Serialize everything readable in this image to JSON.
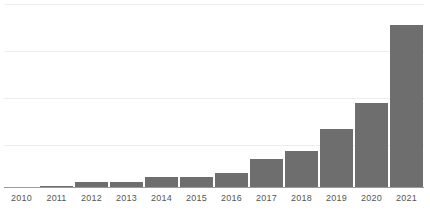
{
  "chart_data": {
    "type": "bar",
    "title": "",
    "subtitle": "",
    "xlabel": "",
    "ylabel": "",
    "categories": [
      "2010",
      "2011",
      "2012",
      "2013",
      "2014",
      "2015",
      "2016",
      "2017",
      "2018",
      "2019",
      "2020",
      "2021"
    ],
    "values": [
      0.0,
      1.2,
      3.4,
      4.0,
      6.5,
      7.0,
      9.5,
      18.0,
      23.0,
      36.0,
      52.0,
      100.0
    ],
    "series": [
      {
        "name": "Value",
        "values": [
          0.0,
          1.2,
          3.4,
          4.0,
          6.5,
          7.0,
          9.5,
          18.0,
          23.0,
          36.0,
          52.0,
          100.0
        ]
      }
    ],
    "ylim": [
      0,
      107
    ],
    "grid": true,
    "gridline_count": 4,
    "legend": false,
    "legend_position": "none",
    "bar_color": "#6e6e6e",
    "gridline_color": "#ededed",
    "axis_color": "#9a9a9a",
    "label_color": "#555555",
    "annotations": []
  }
}
